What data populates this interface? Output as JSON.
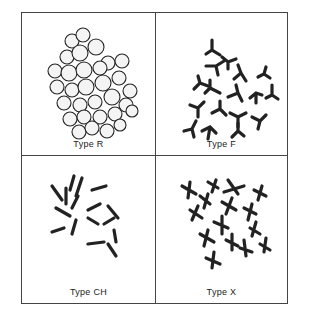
{
  "figure": {
    "panels": [
      {
        "id": "R",
        "label": "Type R",
        "shape": "rounded-clustered"
      },
      {
        "id": "F",
        "label": "Type F",
        "shape": "three-armed"
      },
      {
        "id": "CH",
        "label": "Type CH",
        "shape": "bone"
      },
      {
        "id": "X",
        "label": "Type X",
        "shape": "four-armed-cross"
      }
    ]
  }
}
